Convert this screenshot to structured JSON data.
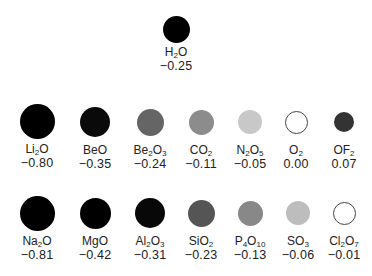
{
  "diagram": {
    "rows": [
      {
        "row": 1,
        "items": [
          {
            "formula_parts": [
              [
                "H",
                ""
              ],
              [
                "2",
                "sub"
              ],
              [
                "O",
                ""
              ]
            ],
            "formula": "H2O",
            "value": "−0.25",
            "cx": 176,
            "cy": 29,
            "d": 27,
            "fill": "#000000",
            "outline": false
          }
        ]
      },
      {
        "row": 2,
        "items": [
          {
            "formula_parts": [
              [
                "Li",
                ""
              ],
              [
                "2",
                "sub"
              ],
              [
                "O",
                ""
              ]
            ],
            "formula": "Li2O",
            "value": "−0.80",
            "cx": 37,
            "cy": 121,
            "d": 35,
            "fill": "#000000",
            "outline": false
          },
          {
            "formula_parts": [
              [
                "BeO",
                ""
              ]
            ],
            "formula": "BeO",
            "value": "−0.35",
            "cx": 95,
            "cy": 122,
            "d": 30,
            "fill": "#0a0a0a",
            "outline": false
          },
          {
            "formula_parts": [
              [
                "Be",
                ""
              ],
              [
                "2",
                "sub"
              ],
              [
                "O",
                ""
              ],
              [
                "3",
                "sub"
              ]
            ],
            "formula": "Be2O3",
            "value": "−0.24",
            "cx": 150,
            "cy": 122,
            "d": 27,
            "fill": "#656565",
            "outline": false
          },
          {
            "formula_parts": [
              [
                "CO",
                ""
              ],
              [
                "2",
                "sub"
              ]
            ],
            "formula": "CO2",
            "value": "−0.11",
            "cx": 201,
            "cy": 122,
            "d": 25,
            "fill": "#8c8c8c",
            "outline": false
          },
          {
            "formula_parts": [
              [
                "N",
                ""
              ],
              [
                "2",
                "sub"
              ],
              [
                "O",
                ""
              ],
              [
                "5",
                "sub"
              ]
            ],
            "formula": "N2O5",
            "value": "−0.05",
            "cx": 250,
            "cy": 122,
            "d": 24,
            "fill": "#c8c8c8",
            "outline": false
          },
          {
            "formula_parts": [
              [
                "O",
                ""
              ],
              [
                "2",
                "sub"
              ]
            ],
            "formula": "O2",
            "value": "0.00",
            "cx": 296,
            "cy": 122,
            "d": 23,
            "fill": "#ffffff",
            "outline": true
          },
          {
            "formula_parts": [
              [
                "OF",
                ""
              ],
              [
                "2",
                "sub"
              ]
            ],
            "formula": "OF2",
            "value": "0.07",
            "cx": 344,
            "cy": 122,
            "d": 20,
            "fill": "#333333",
            "outline": false
          }
        ]
      },
      {
        "row": 3,
        "items": [
          {
            "formula_parts": [
              [
                "Na",
                ""
              ],
              [
                "2",
                "sub"
              ],
              [
                "O",
                ""
              ]
            ],
            "formula": "Na2O",
            "value": "−0.81",
            "cx": 37,
            "cy": 213,
            "d": 35,
            "fill": "#000000",
            "outline": false
          },
          {
            "formula_parts": [
              [
                "MgO",
                ""
              ]
            ],
            "formula": "MgO",
            "value": "−0.42",
            "cx": 95,
            "cy": 213,
            "d": 31,
            "fill": "#000000",
            "outline": false
          },
          {
            "formula_parts": [
              [
                "Al",
                ""
              ],
              [
                "2",
                "sub"
              ],
              [
                "O",
                ""
              ],
              [
                "3",
                "sub"
              ]
            ],
            "formula": "Al2O3",
            "value": "−0.31",
            "cx": 150,
            "cy": 213,
            "d": 30,
            "fill": "#080808",
            "outline": false
          },
          {
            "formula_parts": [
              [
                "SiO",
                ""
              ],
              [
                "2",
                "sub"
              ]
            ],
            "formula": "SiO2",
            "value": "−0.23",
            "cx": 201,
            "cy": 213,
            "d": 27,
            "fill": "#555555",
            "outline": false
          },
          {
            "formula_parts": [
              [
                "P",
                ""
              ],
              [
                "4",
                "sub"
              ],
              [
                "O",
                ""
              ],
              [
                "10",
                "sub"
              ]
            ],
            "formula": "P4O10",
            "value": "−0.13",
            "cx": 250,
            "cy": 213,
            "d": 25,
            "fill": "#888888",
            "outline": false
          },
          {
            "formula_parts": [
              [
                "SO",
                ""
              ],
              [
                "3",
                "sub"
              ]
            ],
            "formula": "SO3",
            "value": "−0.06",
            "cx": 298,
            "cy": 213,
            "d": 24,
            "fill": "#bdbdbd",
            "outline": false
          },
          {
            "formula_parts": [
              [
                "Cl",
                ""
              ],
              [
                "2",
                "sub"
              ],
              [
                "O",
                ""
              ],
              [
                "7",
                "sub"
              ]
            ],
            "formula": "Cl2O7",
            "value": "−0.01",
            "cx": 344,
            "cy": 213,
            "d": 23,
            "fill": "#ffffff",
            "outline": true
          }
        ]
      }
    ]
  }
}
